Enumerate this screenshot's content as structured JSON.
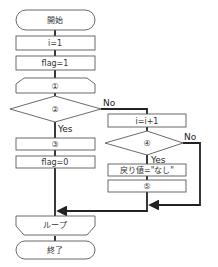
{
  "flowchart": {
    "nodes": {
      "start": "開始",
      "init_i": "i=1",
      "init_flag": "flag=1",
      "loop_start": "①",
      "cond2": "②",
      "step3": "③",
      "set_flag0": "flag=0",
      "inc_i": "i=i+1",
      "cond4": "④",
      "ret_none": "戻り値=\"なし\"",
      "step5": "⑤",
      "loop_end": "ループ",
      "end": "終了"
    },
    "branches": {
      "cond2_yes": "Yes",
      "cond2_no": "No",
      "cond4_yes": "Yes",
      "cond4_no": "No"
    },
    "colors": {
      "stroke": "#5a5a5a",
      "line": "#222222",
      "fill": "#ffffff"
    }
  }
}
